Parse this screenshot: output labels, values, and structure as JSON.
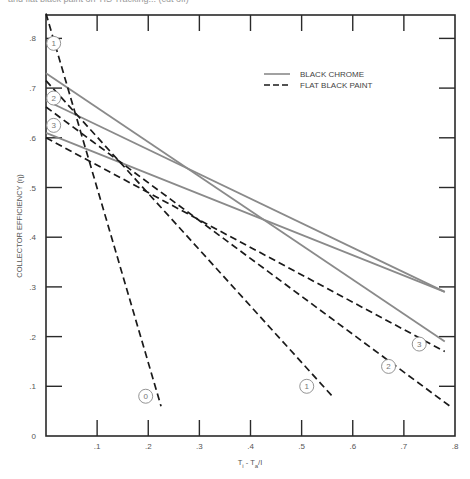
{
  "page": {
    "top_text": "and flat black paint on TIS Tracking... (cut off)"
  },
  "chart_data": {
    "type": "line",
    "title": "",
    "xlabel": "T_i - T_a / I",
    "ylabel": "COLLECTOR EFFICIENCY (η)",
    "xlim": [
      0,
      0.8
    ],
    "ylim": [
      0,
      0.85
    ],
    "grid": false,
    "x_ticks": [
      ".1",
      ".2",
      ".3",
      ".4",
      ".5",
      ".6",
      ".7",
      ".8"
    ],
    "x_tick_values": [
      0.1,
      0.2,
      0.3,
      0.4,
      0.5,
      0.6,
      0.7,
      0.8
    ],
    "y_ticks": [
      "0",
      ".1",
      ".2",
      ".3",
      ".4",
      ".5",
      ".6",
      ".7",
      ".8"
    ],
    "y_tick_values": [
      0,
      0.1,
      0.2,
      0.3,
      0.4,
      0.5,
      0.6,
      0.7,
      0.8
    ],
    "legend": {
      "position": "upper-right",
      "entries": [
        {
          "label": "BLACK CHROME",
          "style": "solid",
          "color": "#8a8a8a"
        },
        {
          "label": "FLAT BLACK PAINT",
          "style": "dashed",
          "color": "#1a1a1a"
        }
      ]
    },
    "series": [
      {
        "name": "Black Chrome 1",
        "coating": "BLACK CHROME",
        "style": "solid",
        "label": "1",
        "x": [
          0,
          0.78
        ],
        "y": [
          0.73,
          0.19
        ]
      },
      {
        "name": "Black Chrome 2",
        "coating": "BLACK CHROME",
        "style": "solid",
        "label": "2",
        "x": [
          0,
          0.78
        ],
        "y": [
          0.675,
          0.29
        ]
      },
      {
        "name": "Black Chrome 3",
        "coating": "BLACK CHROME",
        "style": "solid",
        "label": "3",
        "x": [
          0,
          0.78
        ],
        "y": [
          0.61,
          0.29
        ]
      },
      {
        "name": "Flat Black Paint 0",
        "coating": "FLAT BLACK PAINT",
        "style": "dashed",
        "label": "0",
        "x": [
          0,
          0.225
        ],
        "y": [
          0.85,
          0.06
        ]
      },
      {
        "name": "Flat Black Paint 1",
        "coating": "FLAT BLACK PAINT",
        "style": "dashed",
        "label": "1",
        "x": [
          0,
          0.56
        ],
        "y": [
          0.715,
          0.08
        ]
      },
      {
        "name": "Flat Black Paint 2",
        "coating": "FLAT BLACK PAINT",
        "style": "dashed",
        "label": "2",
        "x": [
          0,
          0.79
        ],
        "y": [
          0.662,
          0.06
        ]
      },
      {
        "name": "Flat Black Paint 3",
        "coating": "FLAT BLACK PAINT",
        "style": "dashed",
        "label": "3",
        "x": [
          0,
          0.78
        ],
        "y": [
          0.6,
          0.17
        ]
      }
    ],
    "annotations": [
      {
        "text": "1",
        "x": 0.015,
        "y": 0.79,
        "circled": true
      },
      {
        "text": "2",
        "x": 0.015,
        "y": 0.68,
        "circled": true
      },
      {
        "text": "3",
        "x": 0.015,
        "y": 0.625,
        "circled": true
      },
      {
        "text": "0",
        "x": 0.195,
        "y": 0.08,
        "circled": true
      },
      {
        "text": "1",
        "x": 0.51,
        "y": 0.1,
        "circled": true
      },
      {
        "text": "2",
        "x": 0.67,
        "y": 0.14,
        "circled": true
      },
      {
        "text": "3",
        "x": 0.73,
        "y": 0.185,
        "circled": true
      }
    ]
  }
}
